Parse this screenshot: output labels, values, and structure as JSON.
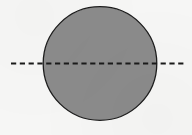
{
  "figure": {
    "kind": "geometry-diagram",
    "canvas": {
      "width": 192,
      "height": 135,
      "background_color": "#f6f6f5"
    },
    "circle": {
      "name": "circle",
      "center_x": 100,
      "center_y": 63.5,
      "radius": 56.8,
      "diameter": 113.6,
      "fill_color": "#8b8b8b",
      "stroke_color": "#1d1d1d",
      "stroke_width": 1.3,
      "bounds": {
        "left": 43.2,
        "right": 156.8,
        "top": 6.7,
        "bottom": 120.3
      }
    },
    "centerline": {
      "name": "horizontal-dashed-centerline",
      "orientation": "horizontal",
      "y": 63.5,
      "x_start": 11,
      "x_end": 185,
      "length": 174,
      "stroke_color": "#1a1a1a",
      "stroke_width": 2.1,
      "dash_length": 5.2,
      "gap_length": 3.6,
      "dash_pattern": "5.2 3.6",
      "extends_beyond_circle": true,
      "overhang_left": 32.2,
      "overhang_right": 28.2
    },
    "labels": [],
    "annotations": []
  }
}
